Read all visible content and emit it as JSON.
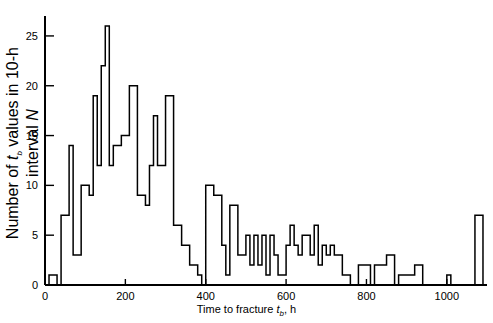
{
  "chart_data": {
    "type": "bar",
    "title": "",
    "subtitle": "",
    "xlabel": "Time to fracture t_b, h",
    "ylabel": "Number of t_b values in 10-h interval N",
    "xlim": [
      0,
      1100
    ],
    "ylim": [
      0,
      27
    ],
    "bin_width": 10,
    "grid": false,
    "legend": null,
    "xticks": [
      0,
      200,
      400,
      600,
      800,
      1000
    ],
    "xtick_labels": [
      "0",
      "200",
      "400",
      "600",
      "800",
      "1000"
    ],
    "yticks": [
      0,
      5,
      10,
      15,
      20,
      25
    ],
    "ytick_labels": [
      "0",
      "5",
      "10",
      "15",
      "20",
      "25"
    ],
    "bin_starts": [
      0,
      10,
      20,
      30,
      40,
      50,
      60,
      70,
      80,
      90,
      100,
      110,
      120,
      130,
      140,
      150,
      160,
      170,
      180,
      190,
      200,
      210,
      220,
      230,
      240,
      250,
      260,
      270,
      280,
      290,
      300,
      310,
      320,
      330,
      340,
      350,
      360,
      370,
      380,
      390,
      400,
      410,
      420,
      430,
      440,
      450,
      460,
      470,
      480,
      490,
      500,
      510,
      520,
      530,
      540,
      550,
      560,
      570,
      580,
      590,
      600,
      610,
      620,
      630,
      640,
      650,
      660,
      670,
      680,
      690,
      700,
      710,
      720,
      730,
      740,
      750,
      760,
      770,
      780,
      790,
      800,
      810,
      820,
      830,
      840,
      850,
      860,
      870,
      880,
      890,
      900,
      910,
      920,
      930,
      940,
      950,
      960,
      970,
      980,
      990,
      1000,
      1010,
      1020,
      1030,
      1040,
      1050,
      1060,
      1070,
      1080,
      1090
    ],
    "values": [
      0,
      1,
      1,
      0,
      7,
      7,
      14,
      3,
      3,
      10,
      10,
      9,
      19,
      12,
      22,
      26,
      12,
      14,
      14,
      15,
      15,
      20,
      20,
      9,
      9,
      8,
      12,
      17,
      12,
      12,
      19,
      19,
      6,
      6,
      4,
      4,
      2,
      2,
      1,
      0,
      10,
      10,
      9,
      9,
      4,
      1,
      8,
      8,
      3,
      3,
      5,
      2,
      5,
      2,
      5,
      1,
      5,
      3,
      1,
      1,
      4,
      6,
      4,
      3,
      5,
      5,
      3,
      6,
      2,
      4,
      3,
      4,
      3,
      3,
      1,
      1,
      0,
      0,
      2,
      2,
      2,
      0,
      2,
      2,
      2,
      3,
      3,
      0,
      1,
      1,
      1,
      1,
      2,
      2,
      0,
      0,
      0,
      0,
      0,
      0,
      1,
      0,
      0,
      0,
      0,
      0,
      0,
      7,
      7,
      0
    ]
  },
  "axis_titles": {
    "x_prefix": "Time to fracture ",
    "x_var": "t",
    "x_sub": "b",
    "x_suffix": ", h",
    "y_prefix": "Number of ",
    "y_var": "t",
    "y_sub": "b",
    "y_mid": " values in 10-h interval ",
    "y_symbol": "N"
  },
  "colors": {
    "line": "#000000",
    "background": "#ffffff",
    "text": "#000000"
  }
}
